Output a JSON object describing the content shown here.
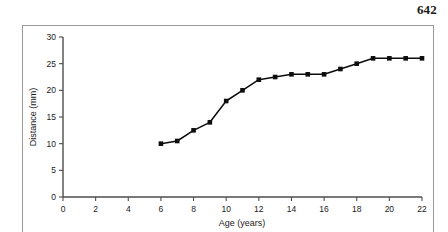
{
  "page": {
    "number": "642"
  },
  "chart_data": {
    "type": "line",
    "title": "",
    "xlabel": "Age (years)",
    "ylabel": "Distance (mm)",
    "xlim": [
      0,
      22
    ],
    "ylim": [
      0,
      30
    ],
    "xticks": [
      0,
      2,
      4,
      6,
      8,
      10,
      12,
      14,
      16,
      18,
      20,
      22
    ],
    "xtick_labels": [
      "0",
      "2",
      "4",
      "6",
      "8",
      "10",
      "12",
      "14",
      "16",
      "18",
      "20",
      "22"
    ],
    "yticks": [
      0,
      5,
      10,
      15,
      20,
      25,
      30
    ],
    "ytick_labels": [
      "0",
      "5",
      "10",
      "15",
      "20",
      "25",
      "30"
    ],
    "grid": false,
    "legend": false,
    "marker": "square",
    "line_color": "#0d0d0d",
    "marker_color": "#0d0d0d",
    "x": [
      6,
      7,
      8,
      9,
      10,
      11,
      12,
      13,
      14,
      15,
      16,
      17,
      18,
      19,
      20,
      21,
      22
    ],
    "values": [
      10,
      10.5,
      12.5,
      14,
      18,
      20,
      22,
      22.5,
      23,
      23,
      23,
      24,
      25,
      26,
      26,
      26,
      26
    ]
  }
}
